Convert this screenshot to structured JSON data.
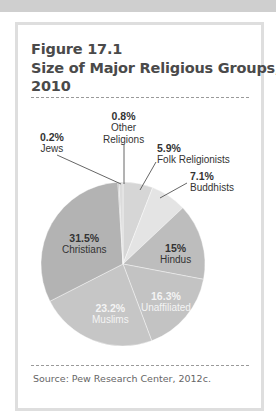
{
  "figure": {
    "number": "Figure 17.1",
    "title_line1": "Size of Major Religious Groups,",
    "title_line2": "2010",
    "source": "Source: Pew Research Center, 2012c."
  },
  "chart_data": {
    "type": "pie",
    "title": "Size of Major Religious Groups, 2010",
    "figure_label": "Figure 17.1",
    "start_angle_deg": 0,
    "direction": "clockwise",
    "unit": "%",
    "slices": [
      {
        "label": "Folk Religionists",
        "value": 5.9,
        "pct_label": "5.9%",
        "color": "#d6d6d6"
      },
      {
        "label": "Buddhists",
        "value": 7.1,
        "pct_label": "7.1%",
        "color": "#e4e4e4"
      },
      {
        "label": "Hindus",
        "value": 15,
        "pct_label": "15%",
        "color": "#bdbdbd"
      },
      {
        "label": "Unaffiliated",
        "value": 16.3,
        "pct_label": "16.3%",
        "color": "#c3c3c3"
      },
      {
        "label": "Muslims",
        "value": 23.2,
        "pct_label": "23.2%",
        "color": "#c6c6c6"
      },
      {
        "label": "Christians",
        "value": 31.5,
        "pct_label": "31.5%",
        "color": "#b3b3b3"
      },
      {
        "label": "Jews",
        "value": 0.2,
        "pct_label": "0.2%",
        "color": "#a8a8a8"
      },
      {
        "label": "Other Religions",
        "value": 0.8,
        "pct_label": "0.8%",
        "color": "#dcdcdc"
      }
    ],
    "source": "Pew Research Center, 2012c."
  },
  "labels": {
    "jews": {
      "pct": "0.2%",
      "name": "Jews"
    },
    "other": {
      "pct": "0.8%",
      "name1": "Other",
      "name2": "Religions"
    },
    "folk": {
      "pct": "5.9%",
      "name": "Folk Religionists"
    },
    "buddhists": {
      "pct": "7.1%",
      "name": "Buddhists"
    },
    "hindus": {
      "pct": "15%",
      "name": "Hindus"
    },
    "unaffiliated": {
      "pct": "16.3%",
      "name": "Unaffiliated"
    },
    "muslims": {
      "pct": "23.2%",
      "name": "Muslims"
    },
    "christians": {
      "pct": "31.5%",
      "name": "Christians"
    }
  }
}
